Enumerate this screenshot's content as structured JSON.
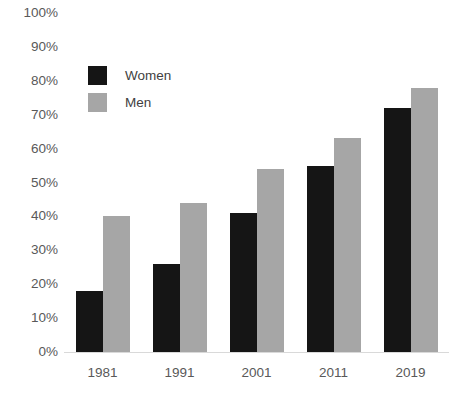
{
  "chart_data": {
    "type": "bar",
    "title": "",
    "xlabel": "",
    "ylabel": "",
    "categories": [
      "1981",
      "1991",
      "2001",
      "2011",
      "2019"
    ],
    "series": [
      {
        "name": "Women",
        "color": "#151515",
        "values": [
          18,
          26,
          41,
          55,
          72
        ]
      },
      {
        "name": "Men",
        "color": "#a6a6a6",
        "values": [
          40,
          44,
          54,
          63,
          78
        ]
      }
    ],
    "ylim": [
      0,
      100
    ],
    "y_ticks": [
      0,
      10,
      20,
      30,
      40,
      50,
      60,
      70,
      80,
      90,
      100
    ],
    "y_tick_labels": [
      "0%",
      "10%",
      "20%",
      "30%",
      "40%",
      "50%",
      "60%",
      "70%",
      "80%",
      "90%",
      "100%"
    ],
    "value_suffix": "%",
    "grid": false,
    "legend_position": "top-left",
    "axis_line_color": "#d9d9d9",
    "tick_label_color": "#595959",
    "background_color": "#ffffff"
  },
  "legend": {
    "items": [
      {
        "label": "Women",
        "color": "#151515"
      },
      {
        "label": "Men",
        "color": "#a6a6a6"
      }
    ]
  }
}
